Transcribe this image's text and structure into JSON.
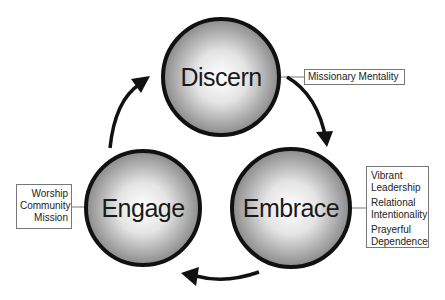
{
  "diagram": {
    "nodes": [
      {
        "id": "discern",
        "label": "Discern",
        "cx": 221,
        "cy": 77,
        "r": 59
      },
      {
        "id": "embrace",
        "label": "Embrace",
        "cx": 291,
        "cy": 208,
        "r": 60
      },
      {
        "id": "engage",
        "label": "Engage",
        "cx": 143,
        "cy": 208,
        "r": 58
      }
    ],
    "annotations": {
      "discern": {
        "lines": [
          "Missionary Mentality"
        ]
      },
      "embrace": {
        "lines": [
          "Vibrant",
          "Leadership",
          "Relational",
          "Intentionality",
          "Prayerful",
          "Dependence"
        ]
      },
      "engage": {
        "lines": [
          "Worship",
          "Community",
          "Mission"
        ]
      }
    },
    "edges": [
      {
        "from": "discern",
        "to": "embrace"
      },
      {
        "from": "embrace",
        "to": "engage"
      },
      {
        "from": "engage",
        "to": "discern"
      }
    ],
    "colors": {
      "circle_stroke": "#111111",
      "circle_center": "#ffffff",
      "circle_edge": "#8a8a8a",
      "arrow": "#111111",
      "box_border": "#777777"
    }
  }
}
